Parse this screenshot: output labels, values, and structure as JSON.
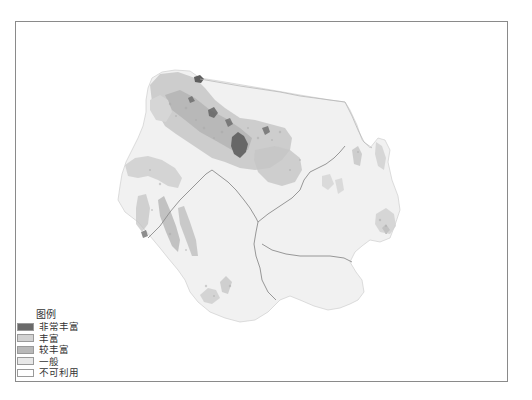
{
  "map": {
    "frame": {
      "left": 15,
      "top": 21,
      "right": 508,
      "bottom": 382,
      "border_color": "#8a8a8a"
    },
    "boundary_color": "#8c8c8c"
  },
  "legend": {
    "title": "图例",
    "items": [
      {
        "label": "非常丰富",
        "color": "#6a6a6a"
      },
      {
        "label": "丰富",
        "color": "#d2d2d2"
      },
      {
        "label": "较丰富",
        "color": "#b8b8b8"
      },
      {
        "label": "一般",
        "color": "#e8e8e8"
      },
      {
        "label": "不可利用",
        "color": "#ffffff"
      }
    ]
  }
}
